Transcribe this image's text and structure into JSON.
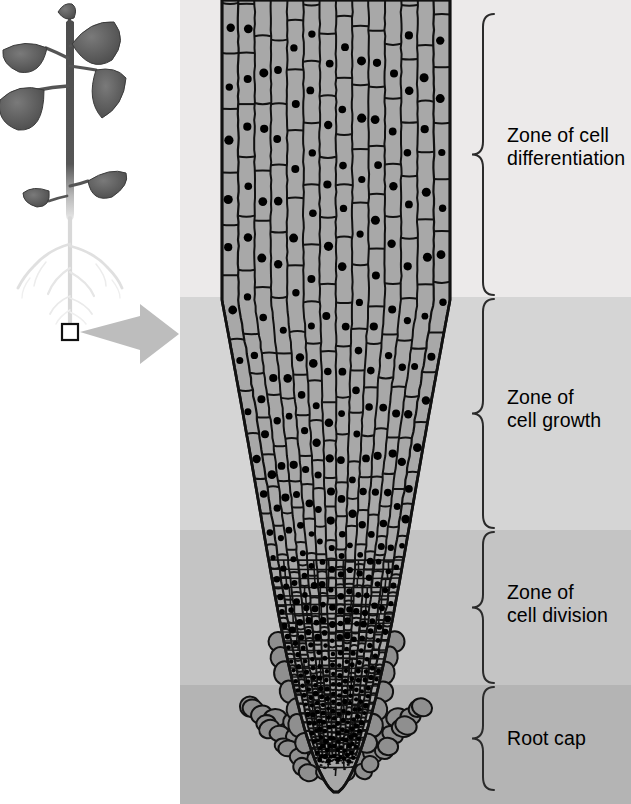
{
  "figure": {
    "kind": "root-tip-zones-diagram"
  },
  "plant": {
    "callout_box_name": "magnified-region-box",
    "arrow_name": "magnification-arrow",
    "description_alt": "Seedling with dark leaves and pale branching root system"
  },
  "panel": {
    "bands": [
      {
        "name": "band-differentiation",
        "color": "#eceaea",
        "top": 0,
        "height": 297
      },
      {
        "name": "band-growth",
        "color": "#d5d5d5",
        "top": 297,
        "height": 233
      },
      {
        "name": "band-division",
        "color": "#c4c4c4",
        "top": 530,
        "height": 155
      },
      {
        "name": "band-rootcap",
        "color": "#b4b4b4",
        "top": 685,
        "height": 119
      }
    ]
  },
  "zones": [
    {
      "id": "differentiation",
      "label_line1": "Zone of cell",
      "label_line2": "differentiation",
      "brace_top": 14,
      "brace_bottom": 295,
      "label_top": 124
    },
    {
      "id": "growth",
      "label_line1": "Zone of",
      "label_line2": "cell growth",
      "brace_top": 299,
      "brace_bottom": 528,
      "label_top": 386
    },
    {
      "id": "division",
      "label_line1": "Zone of",
      "label_line2": "cell division",
      "brace_top": 532,
      "brace_bottom": 683,
      "label_top": 581
    },
    {
      "id": "rootcap",
      "label_line1": "Root cap",
      "label_line2": "",
      "brace_top": 687,
      "brace_bottom": 790,
      "label_top": 727
    }
  ],
  "colors": {
    "cell_fill": "#a8a8a8",
    "cell_stroke": "#111111",
    "nucleus": "#000000",
    "rootcap_fill": "#8f8f8f",
    "brace": "#2b2b2b",
    "arrow": "#b6b6b6",
    "plant_dark": "#555555",
    "plant_root": "#e2e2e2",
    "page_bg": "#ffffff"
  },
  "root_geometry": {
    "left_x": 222,
    "right_x": 450,
    "top_y": 0,
    "tip_y": 795,
    "shoulder_y": 300,
    "note": "Root widens at top, tapers to a rounded tip covered by the root cap"
  }
}
